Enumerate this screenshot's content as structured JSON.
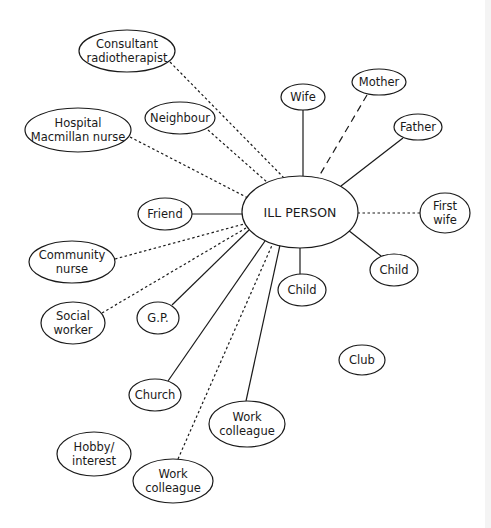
{
  "diagram": {
    "type": "social-network",
    "center": {
      "label": "ILL PERSON",
      "cx": 300,
      "cy": 212,
      "rx": 58,
      "ry": 36
    },
    "nodes": [
      {
        "id": "consultant",
        "lines": [
          "Consultant",
          "radiotherapist"
        ],
        "cx": 127,
        "cy": 51,
        "rx": 48,
        "ry": 21,
        "edge": "dotted",
        "from": [
          170,
          62
        ],
        "to": [
          289,
          183
        ]
      },
      {
        "id": "hospital-nurse",
        "lines": [
          "Hospital",
          "Macmillan nurse"
        ],
        "cx": 78,
        "cy": 130,
        "rx": 53,
        "ry": 22,
        "edge": "dotted",
        "from": [
          130,
          137
        ],
        "to": [
          248,
          198
        ]
      },
      {
        "id": "neighbour",
        "lines": [
          "Neighbour"
        ],
        "cx": 180,
        "cy": 118,
        "rx": 35,
        "ry": 16,
        "edge": "dotted",
        "from": [
          208,
          130
        ],
        "to": [
          268,
          183
        ]
      },
      {
        "id": "wife",
        "lines": [
          "Wife"
        ],
        "cx": 303,
        "cy": 97,
        "rx": 22,
        "ry": 13,
        "edge": "solid",
        "from": [
          303,
          110
        ],
        "to": [
          303,
          176
        ]
      },
      {
        "id": "mother",
        "lines": [
          "Mother"
        ],
        "cx": 379,
        "cy": 82,
        "rx": 27,
        "ry": 13,
        "edge": "dashed",
        "from": [
          367,
          95
        ],
        "to": [
          318,
          178
        ]
      },
      {
        "id": "father",
        "lines": [
          "Father"
        ],
        "cx": 418,
        "cy": 127,
        "rx": 24,
        "ry": 13,
        "edge": "solid",
        "from": [
          403,
          138
        ],
        "to": [
          341,
          186
        ]
      },
      {
        "id": "first-wife",
        "lines": [
          "First",
          "wife"
        ],
        "cx": 445,
        "cy": 213,
        "rx": 25,
        "ry": 20,
        "edge": "dotted",
        "from": [
          420,
          213
        ],
        "to": [
          358,
          213
        ]
      },
      {
        "id": "friend",
        "lines": [
          "Friend"
        ],
        "cx": 165,
        "cy": 214,
        "rx": 27,
        "ry": 16,
        "edge": "solid",
        "from": [
          192,
          214
        ],
        "to": [
          242,
          214
        ]
      },
      {
        "id": "community-nurse",
        "lines": [
          "Community",
          "nurse"
        ],
        "cx": 72,
        "cy": 262,
        "rx": 43,
        "ry": 21,
        "edge": "dotted",
        "from": [
          115,
          259
        ],
        "to": [
          244,
          224
        ]
      },
      {
        "id": "social-worker",
        "lines": [
          "Social",
          "worker"
        ],
        "cx": 73,
        "cy": 323,
        "rx": 32,
        "ry": 21,
        "edge": "dotted",
        "from": [
          102,
          313
        ],
        "to": [
          246,
          228
        ]
      },
      {
        "id": "gp",
        "lines": [
          "G.P."
        ],
        "cx": 158,
        "cy": 318,
        "rx": 21,
        "ry": 16,
        "edge": "solid",
        "from": [
          172,
          305
        ],
        "to": [
          249,
          230
        ]
      },
      {
        "id": "child-center",
        "lines": [
          "Child"
        ],
        "cx": 302,
        "cy": 290,
        "rx": 24,
        "ry": 16,
        "edge": "solid",
        "from": [
          300,
          274
        ],
        "to": [
          300,
          248
        ]
      },
      {
        "id": "child-right",
        "lines": [
          "Child"
        ],
        "cx": 394,
        "cy": 270,
        "rx": 24,
        "ry": 16,
        "edge": "solid",
        "from": [
          381,
          256
        ],
        "to": [
          348,
          230
        ]
      },
      {
        "id": "club",
        "lines": [
          "Club"
        ],
        "cx": 362,
        "cy": 360,
        "rx": 23,
        "ry": 15,
        "edge": "none"
      },
      {
        "id": "church",
        "lines": [
          "Church"
        ],
        "cx": 155,
        "cy": 395,
        "rx": 26,
        "ry": 16,
        "edge": "solid",
        "from": [
          168,
          381
        ],
        "to": [
          265,
          241
        ]
      },
      {
        "id": "work-colleague-right",
        "lines": [
          "Work",
          "colleague"
        ],
        "cx": 247,
        "cy": 424,
        "rx": 38,
        "ry": 23,
        "edge": "solid",
        "from": [
          246,
          401
        ],
        "to": [
          280,
          245
        ]
      },
      {
        "id": "hobby",
        "lines": [
          "Hobby/",
          "interest"
        ],
        "cx": 94,
        "cy": 454,
        "rx": 37,
        "ry": 22,
        "edge": "none"
      },
      {
        "id": "work-colleague-bottom",
        "lines": [
          "Work",
          "colleague"
        ],
        "cx": 173,
        "cy": 481,
        "rx": 40,
        "ry": 22,
        "edge": "dotted",
        "from": [
          178,
          459
        ],
        "to": [
          273,
          243
        ]
      }
    ],
    "edge_styles": {
      "solid": "solid line",
      "dotted": "dotted line",
      "dashed": "dashed line"
    },
    "colors": {
      "stroke": "#1a1a1a",
      "background": "#ffffff"
    }
  }
}
